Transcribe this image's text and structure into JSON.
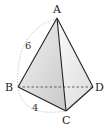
{
  "figure": {
    "type": "tetrahedron",
    "vertices": {
      "A": {
        "label": "A",
        "x": 57,
        "y": 18
      },
      "B": {
        "label": "B",
        "x": 18,
        "y": 87
      },
      "C": {
        "label": "C",
        "x": 66,
        "y": 111
      },
      "D": {
        "label": "D",
        "x": 93,
        "y": 87
      }
    },
    "measurements": {
      "AB": "6",
      "BC": "4"
    },
    "hidden_edge": "BD",
    "colors": {
      "edge": "#222222",
      "face_left": "#d8d8d8",
      "face_right": "#ececec",
      "dotted_arc": "#999999"
    }
  }
}
